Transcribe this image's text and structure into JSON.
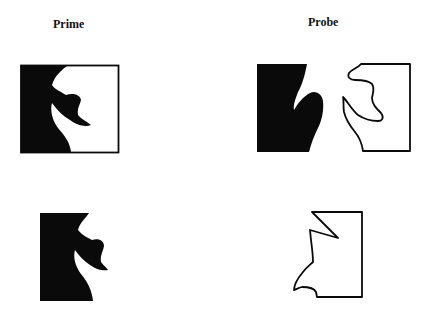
{
  "columns": {
    "prime": {
      "label": "Prime"
    },
    "probe": {
      "label": "Probe"
    }
  },
  "colors": {
    "fill": "#0a0a0a",
    "stroke": "#0a0a0a",
    "background": "#ffffff"
  },
  "stimuli": [
    {
      "row": 1,
      "column": "prime",
      "description": "Black region on left with white region on right, enclosed in square outline"
    },
    {
      "row": 1,
      "column": "probe",
      "description": "Black region and outlined white region separated"
    },
    {
      "row": 2,
      "column": "prime",
      "description": "Black region only"
    },
    {
      "row": 2,
      "column": "probe",
      "description": "Outlined polygonal region only"
    }
  ]
}
